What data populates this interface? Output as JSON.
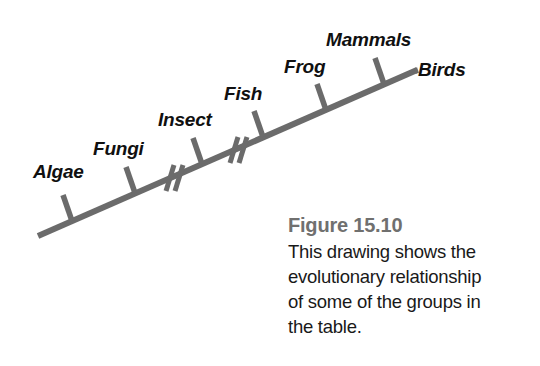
{
  "figure": {
    "title": "Figure 15.10",
    "caption_lines": [
      "This drawing shows the",
      "evolutionary relationship",
      "of some of the groups in",
      "the table."
    ],
    "caption_full": "This drawing shows the evolutionary relationship of some of the groups in the table."
  },
  "colors": {
    "line": "#6b6b6b",
    "tick": "#6b6b6b",
    "break_mark": "#6b6b6b",
    "label_text": "#101010",
    "caption_title": "#70706f",
    "caption_body": "#191919",
    "background": "#ffffff"
  },
  "diagram": {
    "type": "evolutionary-timeline",
    "axis": {
      "x1": 38,
      "y1": 236,
      "x2": 417,
      "y2": 70,
      "stroke_width": 6
    },
    "nodes": [
      {
        "id": "algae",
        "label": "Algae",
        "tick_x": 72,
        "tick_y": 221,
        "tick_top_x": 63,
        "tick_top_y": 195,
        "label_x": 33,
        "label_y": 162
      },
      {
        "id": "fungi",
        "label": "Fungi",
        "tick_x": 135,
        "tick_y": 193,
        "tick_top_x": 126,
        "tick_top_y": 167,
        "label_x": 93,
        "label_y": 139
      },
      {
        "id": "insect",
        "label": "Insect",
        "tick_x": 202,
        "tick_y": 164,
        "tick_top_x": 193,
        "tick_top_y": 138,
        "label_x": 158,
        "label_y": 110
      },
      {
        "id": "fish",
        "label": "Fish",
        "tick_x": 263,
        "tick_y": 137,
        "tick_top_x": 254,
        "tick_top_y": 111,
        "label_x": 224,
        "label_y": 84
      },
      {
        "id": "frog",
        "label": "Frog",
        "tick_x": 326,
        "tick_y": 110,
        "tick_top_x": 317,
        "tick_top_y": 84,
        "label_x": 284,
        "label_y": 57
      },
      {
        "id": "mammals",
        "label": "Mammals",
        "tick_x": 384,
        "tick_y": 84,
        "tick_top_x": 375,
        "tick_top_y": 58,
        "label_x": 326,
        "label_y": 30
      },
      {
        "id": "birds",
        "label": "Birds",
        "tick_x": null,
        "tick_y": null,
        "tick_top_x": null,
        "tick_top_y": null,
        "label_x": 418,
        "label_y": 60
      }
    ],
    "break_marks": [
      {
        "id": "break-1",
        "x": 175,
        "y": 178
      },
      {
        "id": "break-2",
        "x": 239,
        "y": 150
      }
    ]
  },
  "chart_data": {
    "type": "diagram",
    "title": "Figure 15.10",
    "categories": [
      "Algae",
      "Fungi",
      "Insect",
      "Fish",
      "Frog",
      "Mammals",
      "Birds"
    ],
    "order": "earliest to most recent along an ascending diagonal timeline",
    "break_count": 2,
    "break_positions": [
      "between Fungi and Insect",
      "between Insect and Fish"
    ]
  }
}
